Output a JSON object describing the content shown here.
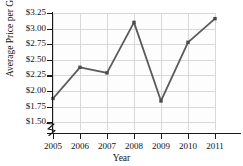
{
  "chart_data": {
    "type": "line",
    "title": "Price in the United States",
    "xlabel": "Year",
    "ylabel": "Average Price per Gallon",
    "categories": [
      "2005",
      "2006",
      "2007",
      "2008",
      "2009",
      "2010",
      "2011"
    ],
    "x": [
      2005,
      2006,
      2007,
      2008,
      2009,
      2010,
      2011
    ],
    "values": [
      1.88,
      2.38,
      2.29,
      3.1,
      1.84,
      2.78,
      3.16
    ],
    "ylim": [
      1.375,
      3.25
    ],
    "ytick_values": [
      1.5,
      1.75,
      2.0,
      2.25,
      2.5,
      2.75,
      3.0,
      3.25
    ],
    "ytick_labels": [
      "$1.50",
      "$1.75",
      "$2.00",
      "$2.25",
      "$2.50",
      "$2.75",
      "$3.00",
      "$3.25"
    ],
    "xtick_labels": [
      "2005",
      "2006",
      "2007",
      "2008",
      "2009",
      "2010",
      "2011"
    ],
    "grid": true,
    "legend": "none",
    "axis_break_y": true,
    "line_color": "#5a5a5a",
    "marker": "square",
    "marker_color": "#4a4a4a",
    "grid_color": "#d8d8d8",
    "axis_color": "#1a1a1a"
  }
}
